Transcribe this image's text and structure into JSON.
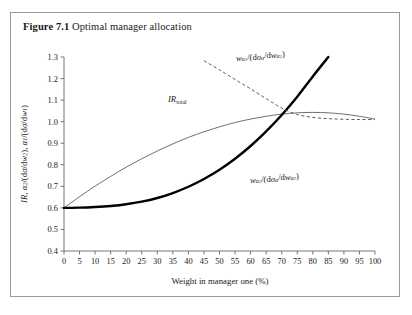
{
  "figure": {
    "label": "Figure 7.1",
    "title": "Optimal manager allocation"
  },
  "chart_data": {
    "type": "line",
    "title": "Optimal manager allocation",
    "xlabel": "Weight in manager one (%)",
    "ylabel": "IR, α₂/(dσ/dw₂), α₁/(dσ/dw₁)",
    "xlim": [
      0,
      100
    ],
    "ylim": [
      0.4,
      1.3
    ],
    "xticks": [
      0,
      5,
      10,
      15,
      20,
      25,
      30,
      35,
      40,
      45,
      50,
      55,
      60,
      65,
      70,
      75,
      80,
      85,
      90,
      95,
      100
    ],
    "yticks": [
      0.4,
      0.5,
      0.6,
      0.7,
      0.8,
      0.9,
      1.0,
      1.1,
      1.2,
      1.3
    ],
    "xtick_labels": [
      "0",
      "5",
      "10",
      "15",
      "20",
      "25",
      "30",
      "35",
      "40",
      "45",
      "50",
      "55",
      "60",
      "65",
      "70",
      "75",
      "80",
      "85",
      "90",
      "95",
      "100"
    ],
    "ytick_labels": [
      "0.4",
      "0.5",
      "0.6",
      "0.7",
      "0.8",
      "0.9",
      "1.0",
      "1.1",
      "1.2",
      "1.3"
    ],
    "grid": false,
    "legend": "inline-annotations",
    "series": [
      {
        "name": "IR_total",
        "style": "thin-solid",
        "color": "#555555",
        "x": [
          0,
          5,
          10,
          15,
          20,
          25,
          30,
          35,
          40,
          45,
          50,
          55,
          60,
          65,
          70,
          75,
          80,
          85,
          90,
          95,
          100
        ],
        "values": [
          0.6,
          0.652,
          0.701,
          0.746,
          0.789,
          0.828,
          0.864,
          0.897,
          0.927,
          0.953,
          0.976,
          0.996,
          1.012,
          1.025,
          1.035,
          1.041,
          1.043,
          1.041,
          1.035,
          1.025,
          1.012
        ]
      },
      {
        "name": "w_alpha2/(dsigma_alpha/dw_alpha2)",
        "style": "thick-solid",
        "color": "#000000",
        "x": [
          0,
          5,
          10,
          15,
          20,
          25,
          30,
          35,
          40,
          45,
          50,
          55,
          60,
          65,
          70,
          75,
          80,
          85
        ],
        "values": [
          0.6,
          0.601,
          0.604,
          0.609,
          0.617,
          0.629,
          0.646,
          0.669,
          0.698,
          0.734,
          0.777,
          0.828,
          0.887,
          0.955,
          1.031,
          1.116,
          1.21,
          1.3
        ]
      },
      {
        "name": "w_alpha1/(dsigma_alpha/dw_alpha1)",
        "style": "dashed",
        "color": "#555555",
        "x": [
          45,
          50,
          55,
          60,
          65,
          70,
          75,
          80,
          85,
          90,
          95,
          100
        ],
        "values": [
          1.283,
          1.24,
          1.196,
          1.152,
          1.107,
          1.063,
          1.033,
          1.02,
          1.014,
          1.011,
          1.01,
          1.01
        ]
      }
    ],
    "annotations": [
      {
        "name": "ir-total-label",
        "text": "IR",
        "subscript": "total",
        "x": 33,
        "y": 1.115
      },
      {
        "name": "alpha1-curve-label",
        "text": "w",
        "x": 62,
        "y": 1.275
      },
      {
        "name": "alpha2-curve-label",
        "text": "w",
        "x": 66,
        "y": 0.735
      }
    ]
  }
}
